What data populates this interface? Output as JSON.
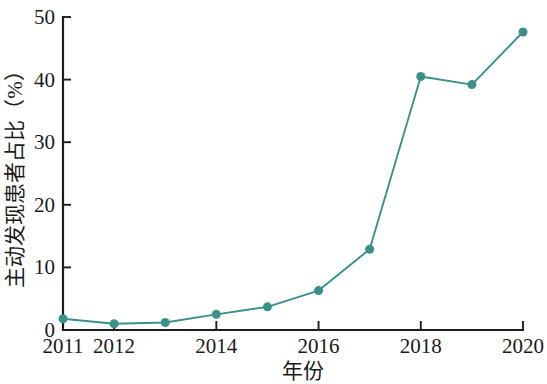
{
  "chart_data": {
    "type": "line",
    "title": "",
    "subtitle": "",
    "xlabel": "年份",
    "ylabel": "主动发现患者占比（%）",
    "x": [
      2011,
      2012,
      2013,
      2014,
      2015,
      2016,
      2017,
      2018,
      2019,
      2020
    ],
    "values": [
      1.8,
      1.0,
      1.2,
      2.5,
      3.7,
      6.3,
      12.9,
      40.5,
      39.2,
      47.6
    ],
    "series": [
      {
        "name": "主动发现患者占比",
        "values": [
          1.8,
          1.0,
          1.2,
          2.5,
          3.7,
          6.3,
          12.9,
          40.5,
          39.2,
          47.6
        ]
      }
    ],
    "xlim": [
      2011,
      2020
    ],
    "ylim": [
      0,
      50
    ],
    "x_tick_values": [
      2011,
      2012,
      2014,
      2016,
      2018,
      2020
    ],
    "x_tick_labels": [
      "2011",
      "2012",
      "2014",
      "2016",
      "2018",
      "2020"
    ],
    "y_tick_values": [
      0,
      10,
      20,
      30,
      40,
      50
    ],
    "y_tick_labels": [
      "0",
      "10",
      "20",
      "30",
      "40",
      "50"
    ],
    "grid": false,
    "legend": false,
    "legend_position": "none",
    "marker": "circle",
    "marker_size": 9,
    "series_color": "#3a9188",
    "axis_color": "#1d1d1d",
    "background_color": "#ffffff",
    "annotations": []
  }
}
